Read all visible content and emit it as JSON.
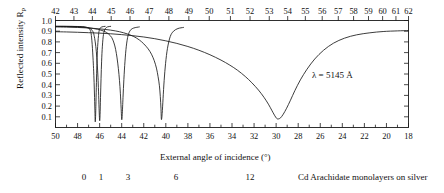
{
  "figure": {
    "ylabel": "Reflected intensity R",
    "ylabel_sub": "p",
    "xlabel": "External angle of incidence (°)",
    "annotation": "λ = 5145 Å",
    "caption_text": "Cd Arachidate monolayers on silver",
    "caption_numbers": [
      "0",
      "1",
      "3",
      "6",
      "12"
    ]
  },
  "chart_data": {
    "type": "line",
    "title": "",
    "subtitle": "",
    "xlabel": "External angle of incidence (°)",
    "ylabel": "Reflected intensity R p",
    "xlabel_top": "",
    "annotations": [
      {
        "text": "λ = 5145 Å",
        "x": 31.0,
        "y": 0.45
      },
      {
        "text": "Cd Arachidate monolayers on silver",
        "x": null,
        "y": null
      }
    ],
    "grid": false,
    "legend": "none",
    "axis_bottom": {
      "name": "External angle of incidence (°)",
      "range": [
        50,
        18
      ],
      "direction": "decreasing-left-to-right",
      "ticks": [
        50,
        49,
        48,
        47,
        46,
        45,
        44,
        43,
        42,
        41,
        40,
        39,
        38,
        37,
        36,
        35,
        34,
        33,
        32,
        31,
        30,
        29,
        28,
        27,
        26,
        25,
        24,
        23,
        22,
        21,
        20,
        19,
        18
      ],
      "labeled_ticks": [
        50,
        48,
        46,
        44,
        42,
        40,
        38,
        36,
        34,
        32,
        30,
        28,
        26,
        24,
        22,
        20,
        18
      ]
    },
    "axis_top": {
      "name": "",
      "range": [
        42,
        62
      ],
      "direction": "increasing-left-to-right",
      "ticks": [
        42,
        43,
        44,
        45,
        46,
        47,
        48,
        49,
        50,
        51,
        52,
        53,
        54,
        55,
        56,
        57,
        58,
        59,
        60,
        61,
        62
      ],
      "labeled_ticks": [
        42,
        43,
        44,
        45,
        46,
        47,
        48,
        49,
        50,
        51,
        52,
        53,
        54,
        55,
        56,
        57,
        58,
        59,
        60,
        61,
        62
      ],
      "nonlinear": true
    },
    "ylim": [
      0,
      1.0
    ],
    "yticks": [
      0.1,
      0.2,
      0.3,
      0.4,
      0.5,
      0.6,
      0.7,
      0.8,
      0.9,
      1.0
    ],
    "ytick_labels": [
      "0.1",
      "0.2",
      "0.3",
      "0.4",
      "0.5",
      "0.6",
      "0.7",
      "0.8",
      "0.9",
      "1.0"
    ],
    "series": [
      {
        "name": "0 monolayers",
        "label": "0",
        "minimum_angle": 46.4,
        "minimum_value": 0.05,
        "baseline": 0.945,
        "width": 0.55,
        "points": [
          [
            50.0,
            0.945
          ],
          [
            49.0,
            0.945
          ],
          [
            48.0,
            0.944
          ],
          [
            47.4,
            0.94
          ],
          [
            47.0,
            0.93
          ],
          [
            46.9,
            0.918
          ],
          [
            46.8,
            0.895
          ],
          [
            46.75,
            0.86
          ],
          [
            46.7,
            0.81
          ],
          [
            46.65,
            0.74
          ],
          [
            46.6,
            0.65
          ],
          [
            46.55,
            0.55
          ],
          [
            46.5,
            0.42
          ],
          [
            46.46,
            0.28
          ],
          [
            46.42,
            0.13
          ],
          [
            46.4,
            0.055
          ],
          [
            46.37,
            0.09
          ],
          [
            46.33,
            0.24
          ],
          [
            46.29,
            0.42
          ],
          [
            46.25,
            0.58
          ],
          [
            46.2,
            0.72
          ],
          [
            46.1,
            0.86
          ],
          [
            46.0,
            0.92
          ],
          [
            45.8,
            0.94
          ],
          [
            45.5,
            0.945
          ]
        ]
      },
      {
        "name": "1 monolayer",
        "label": "1",
        "minimum_angle": 46.0,
        "minimum_value": 0.06,
        "baseline": 0.945,
        "width": 0.6,
        "points": [
          [
            50.0,
            0.945
          ],
          [
            49.0,
            0.945
          ],
          [
            48.0,
            0.943
          ],
          [
            47.2,
            0.936
          ],
          [
            46.8,
            0.92
          ],
          [
            46.6,
            0.895
          ],
          [
            46.5,
            0.86
          ],
          [
            46.4,
            0.8
          ],
          [
            46.3,
            0.71
          ],
          [
            46.22,
            0.6
          ],
          [
            46.15,
            0.47
          ],
          [
            46.1,
            0.34
          ],
          [
            46.05,
            0.18
          ],
          [
            46.0,
            0.065
          ],
          [
            45.96,
            0.12
          ],
          [
            45.92,
            0.28
          ],
          [
            45.87,
            0.46
          ],
          [
            45.82,
            0.62
          ],
          [
            45.75,
            0.76
          ],
          [
            45.65,
            0.87
          ],
          [
            45.5,
            0.92
          ],
          [
            45.3,
            0.94
          ],
          [
            45.0,
            0.945
          ]
        ]
      },
      {
        "name": "3 monolayers",
        "label": "3",
        "minimum_angle": 44.0,
        "minimum_value": 0.07,
        "baseline": 0.94,
        "width": 0.9,
        "points": [
          [
            50.0,
            0.945
          ],
          [
            49.0,
            0.944
          ],
          [
            48.0,
            0.94
          ],
          [
            47.0,
            0.932
          ],
          [
            46.2,
            0.918
          ],
          [
            45.6,
            0.9
          ],
          [
            45.2,
            0.875
          ],
          [
            44.9,
            0.84
          ],
          [
            44.7,
            0.79
          ],
          [
            44.55,
            0.73
          ],
          [
            44.42,
            0.65
          ],
          [
            44.3,
            0.55
          ],
          [
            44.2,
            0.44
          ],
          [
            44.12,
            0.32
          ],
          [
            44.05,
            0.18
          ],
          [
            44.0,
            0.075
          ],
          [
            43.95,
            0.12
          ],
          [
            43.88,
            0.28
          ],
          [
            43.8,
            0.45
          ],
          [
            43.7,
            0.62
          ],
          [
            43.58,
            0.76
          ],
          [
            43.42,
            0.86
          ],
          [
            43.2,
            0.91
          ],
          [
            42.9,
            0.93
          ],
          [
            42.4,
            0.94
          ]
        ]
      },
      {
        "name": "6 monolayers",
        "label": "6",
        "minimum_angle": 40.4,
        "minimum_value": 0.07,
        "baseline": 0.925,
        "width": 1.5,
        "points": [
          [
            50.0,
            0.94
          ],
          [
            49.0,
            0.938
          ],
          [
            48.0,
            0.935
          ],
          [
            47.0,
            0.93
          ],
          [
            46.0,
            0.922
          ],
          [
            45.0,
            0.91
          ],
          [
            44.2,
            0.895
          ],
          [
            43.5,
            0.875
          ],
          [
            42.9,
            0.85
          ],
          [
            42.4,
            0.818
          ],
          [
            42.0,
            0.782
          ],
          [
            41.6,
            0.735
          ],
          [
            41.3,
            0.685
          ],
          [
            41.05,
            0.625
          ],
          [
            40.85,
            0.555
          ],
          [
            40.7,
            0.475
          ],
          [
            40.58,
            0.39
          ],
          [
            40.5,
            0.29
          ],
          [
            40.44,
            0.18
          ],
          [
            40.4,
            0.075
          ],
          [
            40.33,
            0.13
          ],
          [
            40.25,
            0.27
          ],
          [
            40.15,
            0.44
          ],
          [
            40.02,
            0.6
          ],
          [
            39.85,
            0.74
          ],
          [
            39.6,
            0.85
          ],
          [
            39.3,
            0.9
          ],
          [
            38.9,
            0.925
          ],
          [
            38.4,
            0.935
          ]
        ]
      },
      {
        "name": "12 monolayers",
        "label": "12",
        "minimum_angle": 29.9,
        "minimum_value": 0.08,
        "baseline": 0.88,
        "width": 4.5,
        "points": [
          [
            50.0,
            0.895
          ],
          [
            49.0,
            0.893
          ],
          [
            48.0,
            0.89
          ],
          [
            47.0,
            0.886
          ],
          [
            46.0,
            0.882
          ],
          [
            45.0,
            0.876
          ],
          [
            44.0,
            0.868
          ],
          [
            43.0,
            0.858
          ],
          [
            42.0,
            0.846
          ],
          [
            41.0,
            0.83
          ],
          [
            40.0,
            0.81
          ],
          [
            39.0,
            0.786
          ],
          [
            38.0,
            0.757
          ],
          [
            37.0,
            0.722
          ],
          [
            36.0,
            0.68
          ],
          [
            35.0,
            0.63
          ],
          [
            34.2,
            0.583
          ],
          [
            33.5,
            0.535
          ],
          [
            32.8,
            0.477
          ],
          [
            32.2,
            0.418
          ],
          [
            31.6,
            0.35
          ],
          [
            31.1,
            0.282
          ],
          [
            30.7,
            0.218
          ],
          [
            30.4,
            0.162
          ],
          [
            30.15,
            0.115
          ],
          [
            29.95,
            0.085
          ],
          [
            29.8,
            0.08
          ],
          [
            29.6,
            0.09
          ],
          [
            29.35,
            0.125
          ],
          [
            29.05,
            0.18
          ],
          [
            28.7,
            0.255
          ],
          [
            28.3,
            0.345
          ],
          [
            27.8,
            0.445
          ],
          [
            27.2,
            0.545
          ],
          [
            26.5,
            0.64
          ],
          [
            25.7,
            0.722
          ],
          [
            24.8,
            0.788
          ],
          [
            23.8,
            0.835
          ],
          [
            22.7,
            0.866
          ],
          [
            21.5,
            0.885
          ],
          [
            20.3,
            0.897
          ],
          [
            19.0,
            0.903
          ],
          [
            18.0,
            0.906
          ]
        ]
      }
    ]
  }
}
